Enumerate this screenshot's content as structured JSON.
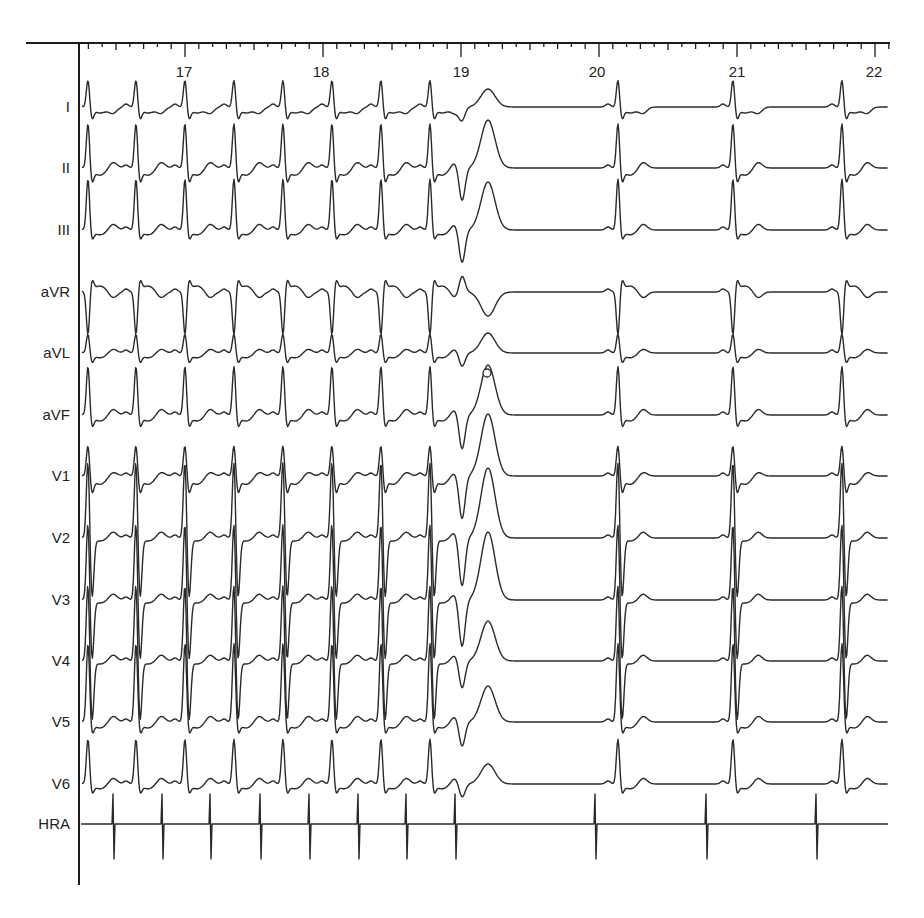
{
  "chart_data": {
    "type": "line",
    "title": "",
    "xlabel": "Time (s)",
    "ylabel": "",
    "x_ticks": [
      17,
      18,
      19,
      20,
      21,
      22
    ],
    "x_tick_px": [
      185,
      322,
      462,
      598,
      738,
      875
    ],
    "xlim": [
      16.2,
      22.1
    ],
    "grid": false,
    "minor_ticks_per_second": 10,
    "leads": [
      {
        "name": "I",
        "baseline_y": 107,
        "qrs_amp": -28,
        "s_amp": 10,
        "t_amp": -6,
        "pvc_amp": -18
      },
      {
        "name": "II",
        "baseline_y": 168,
        "qrs_amp": -46,
        "s_amp": 12,
        "t_amp": 6,
        "pvc_amp": -48
      },
      {
        "name": "III",
        "baseline_y": 230,
        "qrs_amp": -52,
        "s_amp": 8,
        "t_amp": 6,
        "pvc_amp": -48
      },
      {
        "name": "aVR",
        "baseline_y": 292,
        "qrs_amp": 44,
        "s_amp": -10,
        "t_amp": -6,
        "pvc_amp": 24
      },
      {
        "name": "aVL",
        "baseline_y": 353,
        "qrs_amp": -20,
        "s_amp": 8,
        "t_amp": 4,
        "pvc_amp": -20
      },
      {
        "name": "aVF",
        "baseline_y": 415,
        "qrs_amp": -50,
        "s_amp": 10,
        "t_amp": 6,
        "pvc_amp": -50
      },
      {
        "name": "V1",
        "baseline_y": 476,
        "qrs_amp": -32,
        "s_amp": 14,
        "t_amp": 4,
        "pvc_amp": -62
      },
      {
        "name": "V2",
        "baseline_y": 538,
        "qrs_amp": -80,
        "s_amp": 60,
        "t_amp": 6,
        "pvc_amp": -70
      },
      {
        "name": "V3",
        "baseline_y": 600,
        "qrs_amp": -80,
        "s_amp": 60,
        "t_amp": 6,
        "pvc_amp": -68
      },
      {
        "name": "V4",
        "baseline_y": 661,
        "qrs_amp": -80,
        "s_amp": 60,
        "t_amp": 6,
        "pvc_amp": -40
      },
      {
        "name": "V5",
        "baseline_y": 722,
        "qrs_amp": -80,
        "s_amp": 10,
        "t_amp": 6,
        "pvc_amp": -36
      },
      {
        "name": "V6",
        "baseline_y": 784,
        "qrs_amp": -46,
        "s_amp": 8,
        "t_amp": 6,
        "pvc_amp": -20
      },
      {
        "name": "HRA",
        "baseline_y": 824,
        "qrs_amp": 0,
        "s_amp": 0,
        "t_amp": 0,
        "pvc_amp": 0
      }
    ],
    "sinus_beat_x": [
      88,
      136,
      185,
      234,
      283,
      332,
      381,
      430
    ],
    "pvc_x": 466,
    "post_pvc_beat_x": [
      618,
      733,
      842
    ],
    "hra_spike_x": [
      113,
      162,
      210,
      260,
      309,
      358,
      406,
      455,
      595,
      706,
      816
    ],
    "annotations": [
      {
        "type": "circle-marker",
        "x": 487,
        "y": 373,
        "note": "small open circle on aVL/aVF trace crossing"
      }
    ]
  },
  "labels": {
    "ticks": [
      "17",
      "18",
      "19",
      "20",
      "21",
      "22"
    ],
    "leads": [
      "I",
      "II",
      "III",
      "aVR",
      "aVL",
      "aVF",
      "V1",
      "V2",
      "V3",
      "V4",
      "V5",
      "V6",
      "HRA"
    ]
  },
  "colors": {
    "trace": "#2a2a2a",
    "axis": "#1a1a1a",
    "background": "#ffffff"
  }
}
